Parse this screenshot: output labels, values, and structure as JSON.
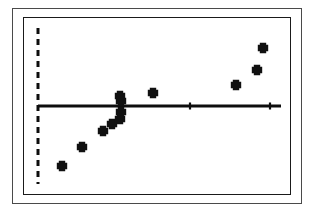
{
  "figure": {
    "kind": "scatter-plot-scan",
    "background_color": "#ffffff",
    "ink_color": "#101010",
    "outer_frame_color": "#4a4a4a",
    "inner_frame_color": "#1a1a1a",
    "caption": ""
  },
  "chart_data": {
    "type": "scatter",
    "title": "",
    "subtitle": "",
    "xlabel": "",
    "ylabel": "",
    "xlim": [
      0,
      100
    ],
    "ylim": [
      0,
      100
    ],
    "grid": false,
    "legend": null,
    "axis_ticks_visible": false,
    "tick_labels_x": [],
    "tick_labels_y": [],
    "series": [
      {
        "name": "observations",
        "marker": "plus",
        "marker_color": "#101010",
        "points": [
          {
            "x": 9.6,
            "y": 22.0
          },
          {
            "x": 17.9,
            "y": 32.6
          },
          {
            "x": 26.2,
            "y": 45.4
          },
          {
            "x": 29.8,
            "y": 50.8
          },
          {
            "x": 33.1,
            "y": 55.4
          },
          {
            "x": 34.9,
            "y": 62.3
          },
          {
            "x": 35.2,
            "y": 70.0
          },
          {
            "x": 35.0,
            "y": 58.5
          },
          {
            "x": 48.3,
            "y": 71.5
          },
          {
            "x": 82.0,
            "y": 77.7
          },
          {
            "x": 90.3,
            "y": 89.2
          },
          {
            "x": 92.9,
            "y": 106.2
          }
        ]
      }
    ],
    "reference_lines": [
      {
        "name": "horizontal-reference-line",
        "orientation": "horizontal",
        "style": "solid",
        "value": 65.0,
        "color": "#0d0d0d"
      },
      {
        "name": "vertical-threshold-line",
        "orientation": "vertical",
        "style": "dashed",
        "value": 2.0,
        "color": "#0d0d0d"
      }
    ],
    "tick_marks_on_reference_line": [
      {
        "x": 35.0
      },
      {
        "x": 63.0
      },
      {
        "x": 96.0
      }
    ]
  },
  "geometry": {
    "hline": {
      "x1": 38,
      "x2": 281,
      "y": 106
    },
    "vline": {
      "x": 38,
      "y1": 28,
      "y2": 184
    },
    "markers": [
      {
        "cx": 62,
        "cy": 166
      },
      {
        "cx": 82,
        "cy": 147
      },
      {
        "cx": 103,
        "cy": 131
      },
      {
        "cx": 112,
        "cy": 124
      },
      {
        "cx": 120,
        "cy": 119
      },
      {
        "cx": 121,
        "cy": 112
      },
      {
        "cx": 121,
        "cy": 101
      },
      {
        "cx": 120,
        "cy": 96
      },
      {
        "cx": 153,
        "cy": 93
      },
      {
        "cx": 236,
        "cy": 85
      },
      {
        "cx": 257,
        "cy": 70
      },
      {
        "cx": 263,
        "cy": 48
      }
    ],
    "line_ticks": [
      {
        "x": 121,
        "y": 106
      },
      {
        "x": 190,
        "y": 106
      },
      {
        "x": 270,
        "y": 106
      }
    ]
  }
}
